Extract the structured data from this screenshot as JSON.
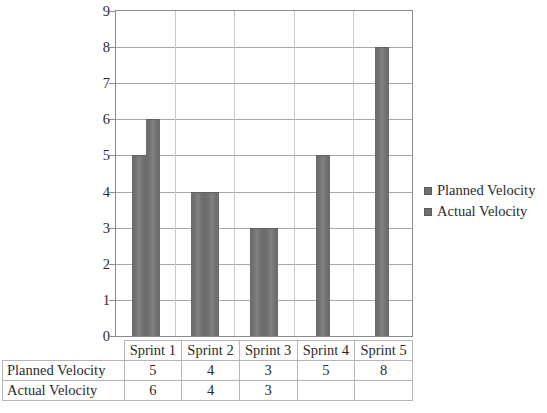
{
  "chart_data": {
    "type": "bar",
    "title": "",
    "xlabel": "",
    "ylabel": "",
    "categories": [
      "Sprint 1",
      "Sprint 2",
      "Sprint 3",
      "Sprint 4",
      "Sprint 5"
    ],
    "series": [
      {
        "name": "Planned Velocity",
        "values": [
          5,
          4,
          3,
          5,
          8
        ],
        "color": "#6f6f6f"
      },
      {
        "name": "Actual Velocity",
        "values": [
          6,
          4,
          3,
          null,
          null
        ],
        "color": "#6f6f6f"
      }
    ],
    "ylim": [
      0,
      9
    ],
    "y_ticks": [
      0,
      1,
      2,
      3,
      4,
      5,
      6,
      7,
      8,
      9
    ],
    "y_tick_labels": [
      "0",
      "1",
      "2",
      "3",
      "4",
      "5",
      "6",
      "7",
      "8",
      "9"
    ],
    "grid": "horizontal",
    "legend_position": "right"
  },
  "legend": {
    "items": [
      {
        "label": "Planned Velocity",
        "marker": "square-marker"
      },
      {
        "label": "Actual Velocity",
        "marker": "square-marker"
      }
    ]
  },
  "table": {
    "corner_label": "",
    "column_headers": [
      "Sprint 1",
      "Sprint 2",
      "Sprint 3",
      "Sprint 4",
      "Sprint 5"
    ],
    "rows": [
      {
        "label": "Planned Velocity",
        "values": [
          "5",
          "4",
          "3",
          "5",
          "8"
        ]
      },
      {
        "label": "Actual Velocity",
        "values": [
          "6",
          "4",
          "3",
          "",
          ""
        ]
      }
    ]
  }
}
